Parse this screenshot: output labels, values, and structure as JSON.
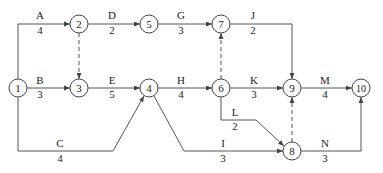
{
  "diagram": {
    "type": "activity-on-arrow network",
    "nodes": [
      {
        "id": "1",
        "x": 18,
        "y": 88
      },
      {
        "id": "2",
        "x": 79,
        "y": 24
      },
      {
        "id": "3",
        "x": 79,
        "y": 88
      },
      {
        "id": "4",
        "x": 149,
        "y": 88
      },
      {
        "id": "5",
        "x": 149,
        "y": 24
      },
      {
        "id": "6",
        "x": 221,
        "y": 88
      },
      {
        "id": "7",
        "x": 221,
        "y": 24
      },
      {
        "id": "8",
        "x": 292,
        "y": 151
      },
      {
        "id": "9",
        "x": 292,
        "y": 88
      },
      {
        "id": "10",
        "x": 361,
        "y": 88
      }
    ],
    "activities": [
      {
        "label": "A",
        "duration": "4",
        "from": "1",
        "to": "2"
      },
      {
        "label": "B",
        "duration": "3",
        "from": "1",
        "to": "3"
      },
      {
        "label": "C",
        "duration": "4",
        "from": "1",
        "to": "4"
      },
      {
        "label": "D",
        "duration": "2",
        "from": "2",
        "to": "5"
      },
      {
        "label": "E",
        "duration": "5",
        "from": "3",
        "to": "4"
      },
      {
        "label": "G",
        "duration": "3",
        "from": "5",
        "to": "7"
      },
      {
        "label": "H",
        "duration": "4",
        "from": "4",
        "to": "6"
      },
      {
        "label": "I",
        "duration": "3",
        "from": "4",
        "to": "8"
      },
      {
        "label": "J",
        "duration": "2",
        "from": "7",
        "to": "9"
      },
      {
        "label": "K",
        "duration": "3",
        "from": "6",
        "to": "9"
      },
      {
        "label": "L",
        "duration": "2",
        "from": "6",
        "to": "8"
      },
      {
        "label": "M",
        "duration": "4",
        "from": "9",
        "to": "10"
      },
      {
        "label": "N",
        "duration": "3",
        "from": "8",
        "to": "10"
      }
    ],
    "dummy_activities": [
      {
        "from": "2",
        "to": "3"
      },
      {
        "from": "6",
        "to": "7"
      },
      {
        "from": "8",
        "to": "9"
      }
    ]
  }
}
